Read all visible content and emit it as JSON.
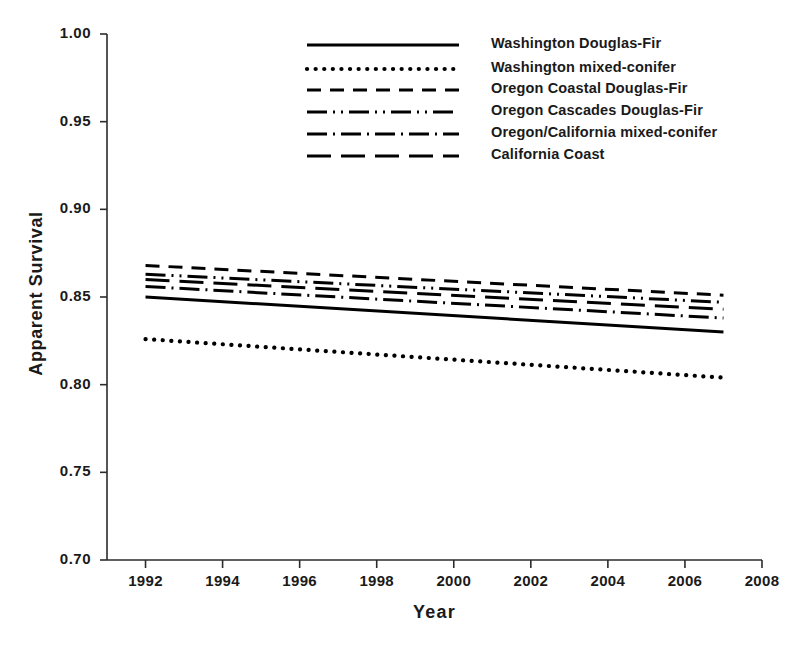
{
  "chart_data": {
    "type": "line",
    "title": "",
    "xlabel": "Year",
    "ylabel": "Apparent Survival",
    "xlim": [
      1991,
      2008
    ],
    "ylim": [
      0.7,
      1.0
    ],
    "grid": false,
    "legend_position": "top-center",
    "x": [
      1992,
      2007
    ],
    "xticks": [
      1992,
      1994,
      1996,
      1998,
      2000,
      2002,
      2004,
      2006,
      2008
    ],
    "xtick_labels": [
      "1992",
      "1994",
      "1996",
      "1998",
      "2000",
      "2002",
      "2004",
      "2006",
      "2008"
    ],
    "yticks": [
      0.7,
      0.75,
      0.8,
      0.85,
      0.9,
      0.95,
      1.0
    ],
    "ytick_labels": [
      "0.70",
      "0.75",
      "0.80",
      "0.85",
      "0.90",
      "0.95",
      "1.00"
    ],
    "series": [
      {
        "name": "Washington Douglas-Fir",
        "style": "solid",
        "dash": "none",
        "values": [
          0.85,
          0.83
        ]
      },
      {
        "name": "Washington mixed-conifer",
        "style": "dotted",
        "dash": "2,6",
        "values": [
          0.826,
          0.804
        ]
      },
      {
        "name": "Oregon Coastal Douglas-Fir",
        "style": "dashed",
        "dash": "14,9",
        "values": [
          0.868,
          0.851
        ]
      },
      {
        "name": "Oregon Cascades Douglas-Fir",
        "style": "dash-dot-dot",
        "dash": "20,6,2,6,2,6",
        "values": [
          0.863,
          0.847
        ]
      },
      {
        "name": "Oregon/California mixed-conifer",
        "style": "dash-dot",
        "dash": "20,6,2,6",
        "values": [
          0.856,
          0.838
        ]
      },
      {
        "name": "California Coast",
        "style": "long-dash",
        "dash": "24,10",
        "values": [
          0.86,
          0.843
        ]
      }
    ],
    "legend_entries": [
      "Washington Douglas-Fir",
      "Washington mixed-conifer",
      "Oregon Coastal Douglas-Fir",
      "Oregon Cascades Douglas-Fir",
      "Oregon/California mixed-conifer",
      "California Coast"
    ],
    "line_color": "#000000",
    "axis_color": "#2b2b2b"
  }
}
